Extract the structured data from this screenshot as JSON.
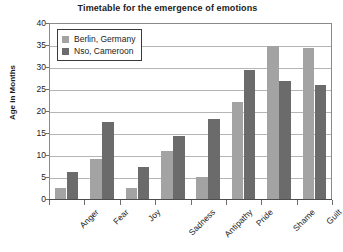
{
  "chart_data": {
    "type": "bar",
    "title": "Timetable for the emergence of emotions",
    "xlabel": "",
    "ylabel": "Age in Months",
    "ylim": [
      0,
      40
    ],
    "ytick_step": 5,
    "yticks": [
      "0",
      "5",
      "10",
      "15",
      "20",
      "25",
      "30",
      "35",
      "40"
    ],
    "grid": "horizontal",
    "legend_position": "top-left-inside",
    "categories": [
      "Anger",
      "Fear",
      "Joy",
      "Sadness",
      "Antipathy",
      "Pride",
      "Shame",
      "Guilt"
    ],
    "series": [
      {
        "name": "Berlin, Germany",
        "color": "#a3a3a3",
        "values": [
          2.6,
          9.2,
          2.4,
          11.0,
          5.1,
          22.0,
          34.7,
          34.4
        ]
      },
      {
        "name": "Nso, Cameroon",
        "color": "#6b6b6b",
        "values": [
          6.1,
          17.6,
          7.3,
          14.4,
          18.2,
          29.4,
          26.8,
          25.8
        ]
      }
    ]
  }
}
